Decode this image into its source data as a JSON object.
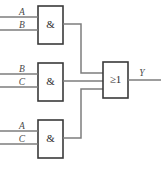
{
  "figure": {
    "caption": "",
    "background_color": "#ffffff",
    "wire_color": "#7d7d7d",
    "gate_border_color": "#3a3a3a",
    "label_color": "#4a4a4a"
  },
  "gates": [
    {
      "id": "and-gate-1",
      "symbol": "&",
      "type": "AND",
      "inputs": [
        "A",
        "B"
      ],
      "position": {
        "x": 38,
        "y": 6,
        "width": 25,
        "height": 38
      }
    },
    {
      "id": "and-gate-2",
      "symbol": "&",
      "type": "AND",
      "inputs": [
        "B",
        "C"
      ],
      "position": {
        "x": 38,
        "y": 63,
        "width": 25,
        "height": 38
      }
    },
    {
      "id": "and-gate-3",
      "symbol": "&",
      "type": "AND",
      "inputs": [
        "A",
        "C"
      ],
      "position": {
        "x": 38,
        "y": 120,
        "width": 25,
        "height": 38
      }
    },
    {
      "id": "or-gate",
      "symbol": "≥1",
      "type": "OR",
      "inputs": [
        "and-gate-1",
        "and-gate-2",
        "and-gate-3"
      ],
      "outputs": [
        "Y"
      ],
      "position": {
        "x": 103,
        "y": 62,
        "width": 25,
        "height": 36
      }
    }
  ],
  "labels": {
    "gate1_input_top": "A",
    "gate1_input_bottom": "B",
    "gate2_input_top": "B",
    "gate2_input_bottom": "C",
    "gate3_input_top": "A",
    "gate3_input_bottom": "C",
    "output": "Y",
    "and_symbol": "&",
    "or_symbol": "≥1"
  }
}
